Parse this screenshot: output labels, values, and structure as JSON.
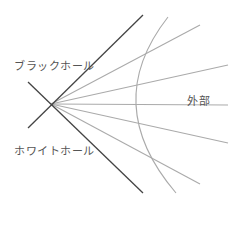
{
  "diagram": {
    "labels": {
      "black_hole": "ブラックホール",
      "white_hole": "ホワイトホール",
      "exterior": "外部"
    },
    "colors": {
      "horizon": "#444444",
      "rays": "#aaaaaa",
      "background": "#ffffff"
    }
  }
}
